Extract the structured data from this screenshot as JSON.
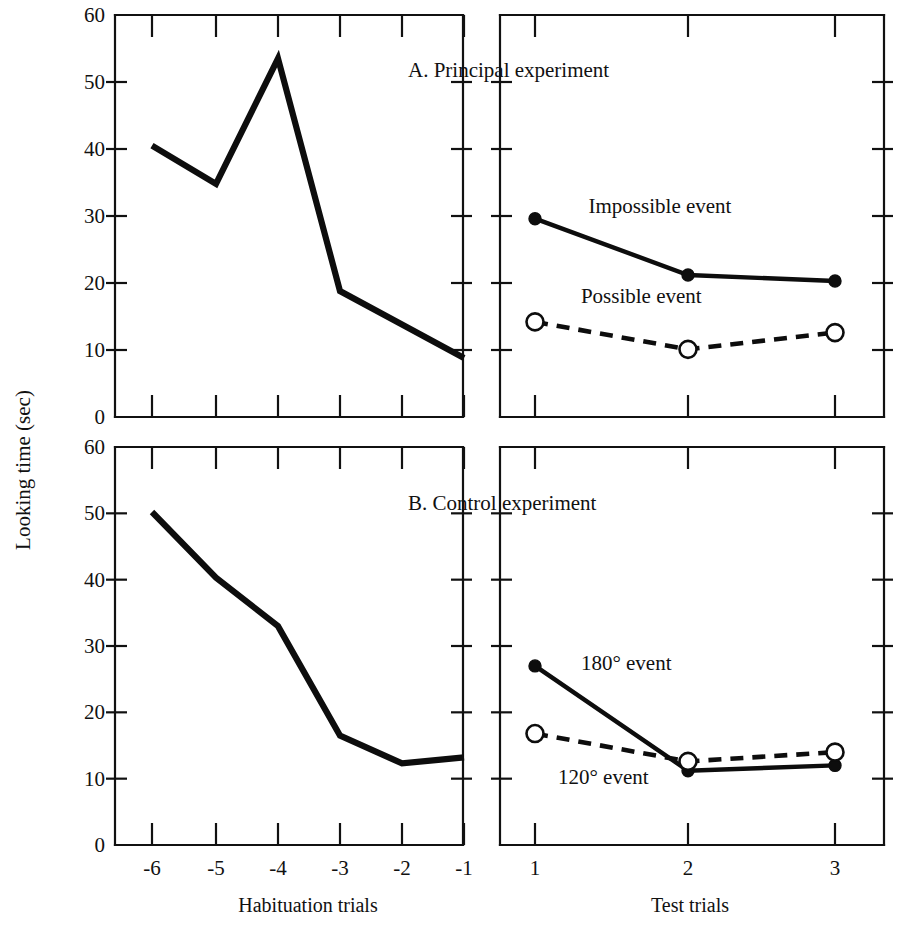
{
  "figure": {
    "y_axis_label": "Looking time (sec)",
    "x_axis_left_label": "Habituation trials",
    "x_axis_right_label": "Test trials",
    "background_color": "#ffffff",
    "ink_color": "#0d0d0d"
  },
  "panels": [
    {
      "id": "panel-a",
      "title": "A. Principal experiment"
    },
    {
      "id": "panel-b",
      "title": "B. Control experiment"
    }
  ],
  "chart_data": [
    {
      "type": "line",
      "title": "A. Principal experiment",
      "subplot": "habituation",
      "xlabel": "Habituation trials",
      "ylabel": "Looking time (sec)",
      "x": [
        "-6",
        "-5",
        "-4",
        "-3",
        "-2",
        "-1"
      ],
      "xticklabels": [
        "-6",
        "-5",
        "-4",
        "-3",
        "-2",
        "-1"
      ],
      "yticklabels": [
        "0",
        "10",
        "20",
        "30",
        "40",
        "50",
        "60"
      ],
      "ylim": [
        0,
        60
      ],
      "grid": false,
      "legend": "none",
      "series": [
        {
          "name": "Habituation",
          "style": "solid",
          "marker": "none",
          "values": [
            40.5,
            34.8,
            53.5,
            18.8,
            13.8,
            8.8
          ]
        }
      ]
    },
    {
      "type": "line",
      "title": "A. Principal experiment",
      "subplot": "test",
      "xlabel": "Test trials",
      "ylabel": "Looking time (sec)",
      "x": [
        "1",
        "2",
        "3"
      ],
      "xticklabels": [
        "1",
        "2",
        "3"
      ],
      "yticklabels": [
        "0",
        "10",
        "20",
        "30",
        "40",
        "50",
        "60"
      ],
      "ylim": [
        0,
        60
      ],
      "grid": false,
      "legend": "inline-annotations",
      "series": [
        {
          "name": "Impossible event",
          "style": "solid",
          "marker": "filled-circle",
          "values": [
            29.6,
            21.2,
            20.3
          ],
          "label_x": "1.35",
          "label_y": "31.5"
        },
        {
          "name": "Possible event",
          "style": "dashed",
          "marker": "open-circle",
          "values": [
            14.2,
            10.1,
            12.6
          ],
          "label_x": "1.3",
          "label_y": "18.0"
        }
      ]
    },
    {
      "type": "line",
      "title": "B. Control experiment",
      "subplot": "habituation",
      "xlabel": "Habituation trials",
      "ylabel": "Looking time (sec)",
      "x": [
        "-6",
        "-5",
        "-4",
        "-3",
        "-2",
        "-1"
      ],
      "xticklabels": [
        "-6",
        "-5",
        "-4",
        "-3",
        "-2",
        "-1"
      ],
      "yticklabels": [
        "0",
        "10",
        "20",
        "30",
        "40",
        "50",
        "60"
      ],
      "ylim": [
        0,
        60
      ],
      "grid": false,
      "legend": "none",
      "series": [
        {
          "name": "Habituation",
          "style": "solid",
          "marker": "none",
          "values": [
            50.2,
            40.3,
            33.0,
            16.5,
            12.3,
            13.2
          ]
        }
      ]
    },
    {
      "type": "line",
      "title": "B. Control experiment",
      "subplot": "test",
      "xlabel": "Test trials",
      "ylabel": "Looking time (sec)",
      "x": [
        "1",
        "2",
        "3"
      ],
      "xticklabels": [
        "1",
        "2",
        "3"
      ],
      "yticklabels": [
        "0",
        "10",
        "20",
        "30",
        "40",
        "50",
        "60"
      ],
      "ylim": [
        0,
        60
      ],
      "grid": false,
      "legend": "inline-annotations",
      "series": [
        {
          "name": "180° event",
          "style": "solid",
          "marker": "filled-circle",
          "values": [
            27.0,
            11.2,
            12.0
          ],
          "label_x": "1.3",
          "label_y": "27.5"
        },
        {
          "name": "120° event",
          "style": "dashed",
          "marker": "open-circle",
          "values": [
            16.8,
            12.6,
            14.0
          ],
          "label_x": "1.15",
          "label_y": "10.3"
        }
      ]
    }
  ],
  "axes": {
    "y_ticks": [
      0,
      10,
      20,
      30,
      40,
      50,
      60
    ],
    "habituation_ticks": [
      "-6",
      "-5",
      "-4",
      "-3",
      "-2",
      "-1"
    ],
    "test_ticks": [
      "1",
      "2",
      "3"
    ]
  }
}
